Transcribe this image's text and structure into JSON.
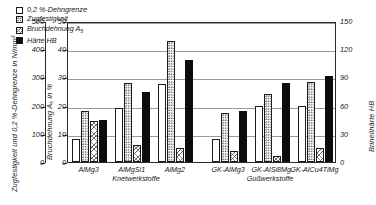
{
  "axes": {
    "left_outer": {
      "title": "Zugfestigkeit und 0,2 %-Dehngrenze in N/mm²",
      "ticks": [
        "0",
        "100",
        "200",
        "300",
        "400",
        "500"
      ]
    },
    "left_inner": {
      "title": "Bruchdehnung A₅ in %",
      "ticks": [
        "0",
        "10",
        "20",
        "30",
        "40",
        "50"
      ]
    },
    "right": {
      "title": "Brinellhärte HB",
      "ticks": [
        "0",
        "30",
        "60",
        "90",
        "120",
        "150"
      ]
    }
  },
  "legend": [
    {
      "label": "0,2 %-Dehngrenze",
      "pattern": "plain"
    },
    {
      "label": "Zugfestigkeit",
      "pattern": "dot"
    },
    {
      "label": "Bruchdehnung A",
      "sub": "5",
      "pattern": "hatch"
    },
    {
      "label": "Härte HB",
      "pattern": "solid"
    }
  ],
  "groups": [
    {
      "label": "AlMg3",
      "section": "Knetwerkstoffe"
    },
    {
      "label": "AlMgSi1",
      "section": "Knetwerkstoffe"
    },
    {
      "label": "AlMg2",
      "section": "Knetwerkstoffe"
    },
    {
      "label": "GK-AlMg3",
      "section": "Gußwerkstoffe"
    },
    {
      "label": "GK-AlSi8Mg",
      "section": "Gußwerkstoffe"
    },
    {
      "label": "GK-AlCu4TiMg",
      "section": "Gußwerkstoffe"
    }
  ],
  "section_titles": {
    "knet": "Knetwerkstoffe",
    "guss": "Gußwerkstoffe"
  },
  "chart_data": {
    "type": "bar",
    "title": "",
    "xlabel": "",
    "ylabel": "Bruchdehnung A₅ in %",
    "ylim": [
      0,
      50
    ],
    "grid": true,
    "legend_position": "top-left",
    "categories": [
      "AlMg3",
      "AlMgSi1",
      "AlMg2",
      "GK-AlMg3",
      "GK-AlSi8Mg",
      "GK-AlCu4TiMg"
    ],
    "axis_scales": {
      "left_outer_unit": "N/mm²",
      "left_outer_range": [
        0,
        500
      ],
      "left_inner_unit": "%",
      "left_inner_range": [
        0,
        50
      ],
      "right_unit": "HB",
      "right_range": [
        0,
        150
      ]
    },
    "series": [
      {
        "name": "0,2 %-Dehngrenze",
        "unit": "N/mm²",
        "axis": "left_outer",
        "pattern": "plain",
        "values": [
          80,
          190,
          275,
          80,
          200,
          200
        ],
        "plot_percent": [
          8,
          19,
          27.5,
          8,
          20,
          20
        ]
      },
      {
        "name": "Zugfestigkeit",
        "unit": "N/mm²",
        "axis": "left_outer",
        "pattern": "dot",
        "values": [
          180,
          280,
          430,
          175,
          240,
          285
        ],
        "plot_percent": [
          18,
          28,
          43,
          17.5,
          24,
          28.5
        ]
      },
      {
        "name": "Bruchdehnung A₅",
        "unit": "%",
        "axis": "left_inner",
        "pattern": "hatch",
        "values": [
          14.5,
          6,
          5,
          4,
          2,
          5
        ],
        "plot_percent": [
          14.5,
          6,
          5,
          4,
          2,
          5
        ]
      },
      {
        "name": "Härte HB",
        "unit": "HB",
        "axis": "right",
        "pattern": "solid",
        "values": [
          45,
          75,
          108,
          54,
          84,
          92
        ],
        "plot_percent": [
          15,
          25,
          36,
          18,
          28,
          30.5
        ]
      }
    ]
  }
}
